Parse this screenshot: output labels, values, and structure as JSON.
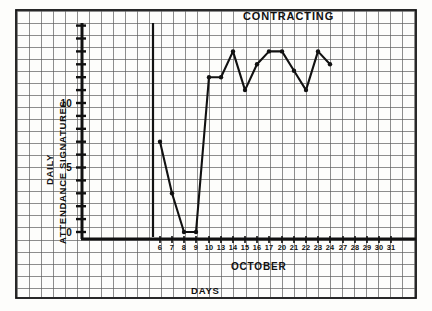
{
  "chart_data": {
    "type": "line",
    "title": "CONTRACTING",
    "xlabel": "DAYS",
    "xlabel_secondary": "OCTOBER",
    "ylabel": "DAILY",
    "ylabel_secondary": "ATTENDANCE SIGNATURES",
    "categories": [
      "6",
      "7",
      "8",
      "9",
      "10",
      "13",
      "14",
      "15",
      "16",
      "17",
      "20",
      "21",
      "22",
      "23",
      "24",
      "27",
      "28",
      "29",
      "30",
      "31"
    ],
    "values": [
      7,
      3,
      0,
      0,
      12,
      12,
      14,
      11,
      13,
      14,
      14,
      12.5,
      11,
      14,
      13,
      null,
      null,
      null,
      null,
      null
    ],
    "ytick_labels": [
      "0",
      "5",
      "10"
    ],
    "ytick_values": [
      0,
      5,
      10
    ],
    "ylim": [
      -1,
      18
    ],
    "grid": true,
    "legend": "none",
    "line_color": "#111111",
    "marker": "circle",
    "series": [
      {
        "name": "Daily attendance signatures",
        "points": [
          {
            "day": "6",
            "value": 7
          },
          {
            "day": "7",
            "value": 3
          },
          {
            "day": "8",
            "value": 0
          },
          {
            "day": "9",
            "value": 0
          },
          {
            "day": "10",
            "value": 12
          },
          {
            "day": "13",
            "value": 12
          },
          {
            "day": "14",
            "value": 14
          },
          {
            "day": "15",
            "value": 11
          },
          {
            "day": "16",
            "value": 13
          },
          {
            "day": "17",
            "value": 14
          },
          {
            "day": "20",
            "value": 14
          },
          {
            "day": "21",
            "value": 12.5
          },
          {
            "day": "22",
            "value": 11
          },
          {
            "day": "23",
            "value": 14
          },
          {
            "day": "24",
            "value": 13
          }
        ]
      }
    ]
  },
  "axes": {
    "top_title": "CONTRACTING",
    "y_title_1": "DAILY",
    "y_title_2": "ATTENDANCE SIGNATURES",
    "x_title_1": "OCTOBER",
    "x_title_2": "DAYS",
    "y_ticks": [
      {
        "label": "10",
        "y": 103
      },
      {
        "label": "5",
        "y": 167
      },
      {
        "label": "0",
        "y": 232
      }
    ],
    "x_ticks": [
      {
        "label": "6",
        "x": 160
      },
      {
        "label": "7",
        "x": 172
      },
      {
        "label": "8",
        "x": 184
      },
      {
        "label": "9",
        "x": 196
      },
      {
        "label": "10",
        "x": 209
      },
      {
        "label": "13",
        "x": 221
      },
      {
        "label": "14",
        "x": 233
      },
      {
        "label": "15",
        "x": 245
      },
      {
        "label": "16",
        "x": 257
      },
      {
        "label": "17",
        "x": 269
      },
      {
        "label": "20",
        "x": 282
      },
      {
        "label": "21",
        "x": 294
      },
      {
        "label": "22",
        "x": 306
      },
      {
        "label": "23",
        "x": 318
      },
      {
        "label": "24",
        "x": 330
      },
      {
        "label": "27",
        "x": 343
      },
      {
        "label": "28",
        "x": 355
      },
      {
        "label": "29",
        "x": 367
      },
      {
        "label": "30",
        "x": 379
      },
      {
        "label": "31",
        "x": 391
      }
    ]
  },
  "colors": {
    "ink": "#111111",
    "grid": "#555555",
    "paper": "#fdfdfb"
  }
}
